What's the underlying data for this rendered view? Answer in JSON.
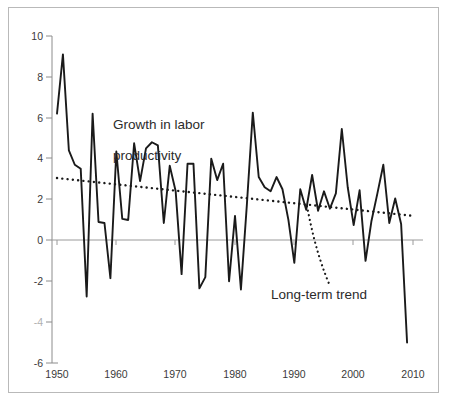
{
  "chart_data": {
    "type": "line",
    "title": "",
    "xlabel": "",
    "ylabel": "",
    "xlim": [
      1950,
      2010
    ],
    "ylim": [
      -6,
      10
    ],
    "grid": false,
    "legend": "none",
    "xticks": [
      "1950",
      "1960",
      "1970",
      "1980",
      "1990",
      "2000",
      "2010"
    ],
    "xtick_values": [
      1950,
      1960,
      1970,
      1980,
      1990,
      2000,
      2010
    ],
    "yticks": [
      "10",
      "8",
      "6",
      "4",
      "2",
      "0",
      "-2",
      "-4",
      "-6"
    ],
    "ytick_values": [
      10,
      8,
      6,
      4,
      2,
      0,
      -2,
      -4,
      -6
    ],
    "zero_line": 0,
    "series": [
      {
        "name": "Growth in labor productivity",
        "style": "solid",
        "color": "#1a1a1a",
        "x": [
          1950,
          1951,
          1952,
          1953,
          1954,
          1955,
          1956,
          1957,
          1958,
          1959,
          1960,
          1961,
          1962,
          1963,
          1964,
          1965,
          1966,
          1967,
          1968,
          1969,
          1970,
          1971,
          1972,
          1973,
          1974,
          1975,
          1976,
          1977,
          1978,
          1979,
          1980,
          1981,
          1982,
          1983,
          1984,
          1985,
          1986,
          1987,
          1988,
          1989,
          1990,
          1991,
          1992,
          1993,
          1994,
          1995,
          1996,
          1997,
          1998,
          1999,
          2000,
          2001,
          2002,
          2003,
          2004,
          2005,
          2006,
          2007,
          2008,
          2009
        ],
        "values": [
          6.2,
          9.1,
          4.4,
          3.7,
          3.5,
          -2.75,
          6.2,
          0.9,
          0.85,
          -1.85,
          4.35,
          1.05,
          1.0,
          4.75,
          2.9,
          4.5,
          4.8,
          4.65,
          0.85,
          3.65,
          2.4,
          -1.65,
          3.75,
          3.75,
          -2.35,
          -1.8,
          4.0,
          2.95,
          3.75,
          -2.0,
          1.2,
          -2.4,
          1.75,
          6.25,
          3.1,
          2.6,
          2.4,
          3.1,
          2.5,
          1.0,
          -1.1,
          2.5,
          1.5,
          3.2,
          1.45,
          2.4,
          1.55,
          2.3,
          5.45,
          2.6,
          0.75,
          2.45,
          -1.0,
          0.95,
          2.3,
          3.7,
          0.85,
          2.05,
          0.8,
          -5.0
        ]
      },
      {
        "name": "Long-term trend",
        "style": "dotted",
        "color": "#1a1a1a",
        "x": [
          1950,
          2010
        ],
        "values": [
          3.05,
          1.2
        ]
      }
    ],
    "annotations": [
      {
        "name": "growth-label",
        "text": "Growth in labor\nproductivity",
        "x": 1960,
        "y": 6.0
      },
      {
        "name": "trend-label",
        "text": "Long-term trend",
        "x": 1992,
        "y": -2.7
      }
    ]
  },
  "axis": {
    "y_labels": [
      "10",
      "8",
      "6",
      "4",
      "2",
      "0",
      "-2",
      "-4",
      "-6"
    ],
    "x_labels": [
      "1950",
      "1960",
      "1970",
      "1980",
      "1990",
      "2000",
      "2010"
    ]
  },
  "labels": {
    "growth_line1": "Growth in labor",
    "growth_line2": "productivity",
    "trend": "Long-term trend"
  },
  "colors": {
    "series": "#1a1a1a",
    "axis": "#8c8c8c",
    "text": "#333333",
    "border": "#b9b9b9",
    "background": "#ffffff"
  }
}
